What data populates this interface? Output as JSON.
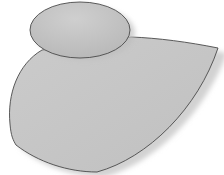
{
  "diagram": {
    "background": "#ffffff",
    "shapes": [
      {
        "id": "body-blob",
        "type": "path",
        "fill": "#c6c6c6",
        "stroke": "#4a4a4a",
        "shadow": "#d8d8d8"
      },
      {
        "id": "head-ellipse",
        "type": "ellipse",
        "cx": 80,
        "cy": 30,
        "rx": 50,
        "ry": 28,
        "fill": "#c2c2c2",
        "stroke": "#4a4a4a"
      }
    ]
  }
}
